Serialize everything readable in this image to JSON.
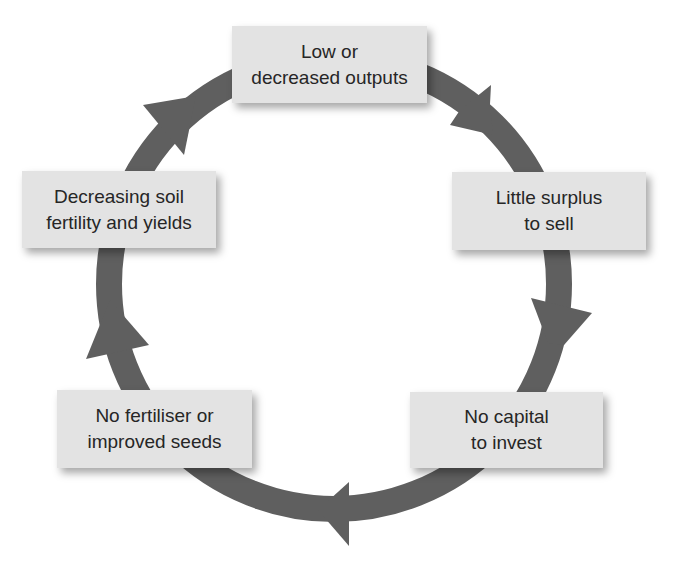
{
  "diagram": {
    "type": "cycle",
    "direction": "clockwise",
    "ring_color": "#5f5f5f",
    "box_fill": "#e3e3e3",
    "text_color": "#262626",
    "nodes": [
      {
        "id": "top",
        "lines": [
          "Low or",
          "decreased outputs"
        ]
      },
      {
        "id": "right",
        "lines": [
          "Little surplus",
          "to sell"
        ]
      },
      {
        "id": "bottom-right",
        "lines": [
          "No capital",
          "to invest"
        ]
      },
      {
        "id": "bottom-left",
        "lines": [
          "No fertiliser or",
          "improved seeds"
        ]
      },
      {
        "id": "left",
        "lines": [
          "Decreasing soil",
          "fertility and yields"
        ]
      }
    ],
    "edges": [
      {
        "from": "top",
        "to": "right"
      },
      {
        "from": "right",
        "to": "bottom-right"
      },
      {
        "from": "bottom-right",
        "to": "bottom-left"
      },
      {
        "from": "bottom-left",
        "to": "left"
      },
      {
        "from": "left",
        "to": "top"
      }
    ]
  }
}
